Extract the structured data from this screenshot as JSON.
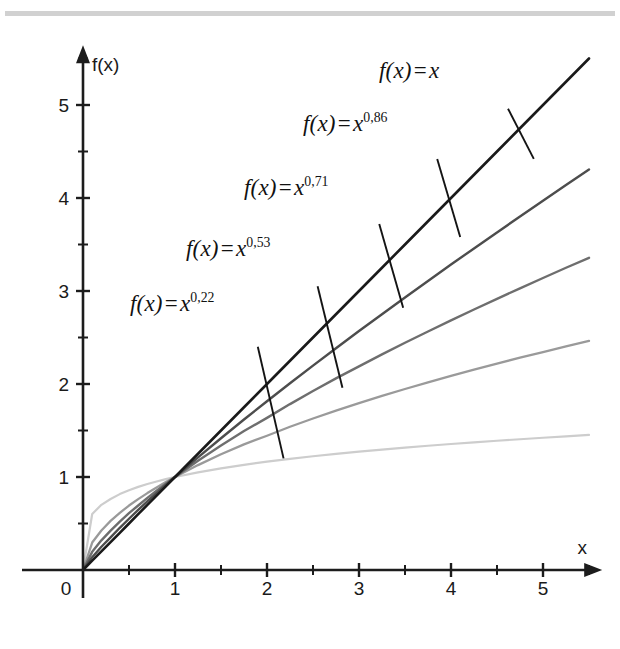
{
  "figure": {
    "width": 620,
    "height": 649,
    "background": "#ffffff",
    "scan_band_color": "#c9c9c9"
  },
  "axes": {
    "x_axis_name": "x",
    "y_axis_name": "f(x)",
    "x_tick_labels": [
      "0",
      "1",
      "2",
      "3",
      "4",
      "5"
    ],
    "y_tick_labels": [
      "1",
      "2",
      "3",
      "4",
      "5"
    ],
    "origin_px": {
      "x": 83,
      "y": 570
    },
    "unit_px": {
      "x": 92,
      "y": 93
    }
  },
  "curve_labels": [
    {
      "id": "label-x-1",
      "prefix": "f",
      "arg": "(x)",
      "eq": "=",
      "base": "x",
      "exponent": "",
      "full_text": "f(x) = x",
      "left": 379,
      "top": 58
    },
    {
      "id": "label-x-086",
      "prefix": "f",
      "arg": "(x)",
      "eq": "=",
      "base": "x",
      "exponent": "0,86",
      "full_text": "f(x) = x0,86",
      "left": 303,
      "top": 111
    },
    {
      "id": "label-x-071",
      "prefix": "f",
      "arg": "(x)",
      "eq": "=",
      "base": "x",
      "exponent": "0,71",
      "full_text": "f(x) = x0,71",
      "left": 244,
      "top": 175
    },
    {
      "id": "label-x-053",
      "prefix": "f",
      "arg": "(x)",
      "eq": "=",
      "base": "x",
      "exponent": "0,53",
      "full_text": "f(x) = x0,53",
      "left": 186,
      "top": 236
    },
    {
      "id": "label-x-022",
      "prefix": "f",
      "arg": "(x)",
      "eq": "=",
      "base": "x",
      "exponent": "0,22",
      "full_text": "f(x) = x0,22",
      "left": 130,
      "top": 291
    }
  ],
  "chart_data": {
    "type": "line",
    "title": "",
    "subtitle": "",
    "xlabel": "x",
    "ylabel": "f(x)",
    "xlim": [
      0,
      5.6
    ],
    "ylim": [
      0,
      5.6
    ],
    "xticks": [
      0,
      1,
      2,
      3,
      4,
      5
    ],
    "yticks": [
      1,
      2,
      3,
      4,
      5
    ],
    "minor_tick_step": 0.5,
    "grid": false,
    "legend": "inline-annotations",
    "decimal_separator": ",",
    "x": [
      0,
      0.1,
      0.2,
      0.3,
      0.4,
      0.5,
      0.6,
      0.7,
      0.8,
      0.9,
      1,
      1.25,
      1.5,
      1.75,
      2,
      2.25,
      2.5,
      2.75,
      3,
      3.25,
      3.5,
      3.75,
      4,
      4.25,
      4.5,
      4.75,
      5,
      5.25,
      5.5
    ],
    "series": [
      {
        "name": "f(x) = x",
        "exponent": 1.0,
        "color": "#1a1a1a",
        "stroke_width": 2.6,
        "x_end": 5.5,
        "y_end": 5.5,
        "values": [
          0,
          0.1,
          0.2,
          0.3,
          0.4,
          0.5,
          0.6,
          0.7,
          0.8,
          0.9,
          1,
          1.25,
          1.5,
          1.75,
          2,
          2.25,
          2.5,
          2.75,
          3,
          3.25,
          3.5,
          3.75,
          4,
          4.25,
          4.5,
          4.75,
          5,
          5.25,
          5.5
        ]
      },
      {
        "name": "f(x) = x^0,86",
        "exponent": 0.86,
        "color": "#4d4d4d",
        "stroke_width": 2.4,
        "x_end": 5.5,
        "y_end": 4.33,
        "values": [
          0,
          0.138,
          0.25,
          0.351,
          0.454,
          0.551,
          0.646,
          0.739,
          0.826,
          0.914,
          1,
          1.211,
          1.417,
          1.618,
          1.815,
          2.008,
          2.198,
          2.385,
          2.569,
          2.751,
          2.931,
          3.108,
          3.284,
          3.458,
          3.63,
          3.801,
          3.971,
          4.139,
          4.306
        ]
      },
      {
        "name": "f(x) = x^0,71",
        "exponent": 0.71,
        "color": "#6e6e6e",
        "stroke_width": 2.4,
        "x_end": 5.5,
        "y_end": 3.37,
        "values": [
          0,
          0.195,
          0.319,
          0.424,
          0.52,
          0.611,
          0.694,
          0.776,
          0.852,
          0.928,
          1,
          1.175,
          1.339,
          1.495,
          1.636,
          1.784,
          1.924,
          2.06,
          2.19,
          2.318,
          2.443,
          2.565,
          2.684,
          2.801,
          2.916,
          3.029,
          3.14,
          3.25,
          3.357
        ]
      },
      {
        "name": "f(x) = x^0,53",
        "exponent": 0.53,
        "color": "#9a9a9a",
        "stroke_width": 2.3,
        "x_end": 5.5,
        "y_end": 2.48,
        "values": [
          0,
          0.295,
          0.425,
          0.528,
          0.614,
          0.693,
          0.762,
          0.827,
          0.888,
          0.945,
          1,
          1.128,
          1.244,
          1.351,
          1.444,
          1.54,
          1.629,
          1.714,
          1.794,
          1.872,
          1.946,
          2.018,
          2.087,
          2.154,
          2.219,
          2.283,
          2.344,
          2.405,
          2.464
        ]
      },
      {
        "name": "f(x) = x^0,22",
        "exponent": 0.22,
        "color": "#cdcdcd",
        "stroke_width": 2.2,
        "x_end": 5.5,
        "y_end": 1.45,
        "values": [
          0,
          0.602,
          0.701,
          0.764,
          0.816,
          0.858,
          0.894,
          0.925,
          0.952,
          0.977,
          1,
          1.05,
          1.093,
          1.131,
          1.165,
          1.195,
          1.223,
          1.249,
          1.272,
          1.295,
          1.316,
          1.336,
          1.355,
          1.373,
          1.39,
          1.406,
          1.422,
          1.437,
          1.452
        ]
      }
    ],
    "annotations": [
      {
        "text": "f(x) = x",
        "series": "f(x) = x",
        "leader_from": [
          4.62,
          4.96
        ],
        "leader_to": [
          4.9,
          4.42
        ]
      },
      {
        "text": "f(x) = x0,86",
        "series": "f(x) = x^0,86",
        "leader_from": [
          3.85,
          4.42
        ],
        "leader_to": [
          4.1,
          3.58
        ]
      },
      {
        "text": "f(x) = x0,71",
        "series": "f(x) = x^0,71",
        "leader_from": [
          3.22,
          3.72
        ],
        "leader_to": [
          3.48,
          2.82
        ]
      },
      {
        "text": "f(x) = x0,53",
        "series": "f(x) = x^0,53",
        "leader_from": [
          2.55,
          3.05
        ],
        "leader_to": [
          2.82,
          1.96
        ]
      },
      {
        "text": "f(x) = x0,22",
        "series": "f(x) = x^0,22",
        "leader_from": [
          1.9,
          2.4
        ],
        "leader_to": [
          2.18,
          1.2
        ]
      }
    ]
  }
}
